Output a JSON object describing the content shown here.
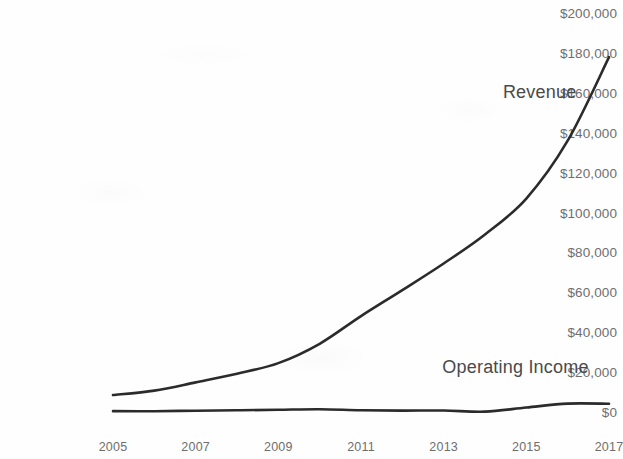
{
  "chart_data": {
    "type": "line",
    "title": "",
    "subtitle": "",
    "xlabel": "",
    "ylabel": "",
    "x": [
      2005,
      2006,
      2007,
      2008,
      2009,
      2010,
      2011,
      2012,
      2013,
      2014,
      2015,
      2016,
      2017
    ],
    "xlim": [
      2005,
      2017
    ],
    "ylim": [
      0,
      200000
    ],
    "ytick_values": [
      0,
      20000,
      40000,
      60000,
      80000,
      100000,
      120000,
      140000,
      160000,
      180000,
      200000
    ],
    "ytick_labels": [
      "$0",
      "$20,000",
      "$40,000",
      "$60,000",
      "$80,000",
      "$100,000",
      "$120,000",
      "$140,000",
      "$160,000",
      "$180,000",
      "$200,000"
    ],
    "xtick_values": [
      2005,
      2007,
      2009,
      2011,
      2013,
      2015,
      2017
    ],
    "xtick_labels": [
      "2005",
      "2007",
      "2009",
      "2011",
      "2013",
      "2015",
      "2017"
    ],
    "grid": false,
    "legend_position": "inline-annotation",
    "series": [
      {
        "name": "Revenue",
        "color": "#2b2b2b",
        "values": [
          8490,
          10710,
          14840,
          19170,
          24510,
          34200,
          48080,
          61090,
          74450,
          88990,
          107010,
          135990,
          177870
        ],
        "label_x": 2016.2,
        "label_y": 160000
      },
      {
        "name": "Operating Income",
        "color": "#2b2b2b",
        "values": [
          430,
          390,
          660,
          840,
          1130,
          1410,
          860,
          680,
          740,
          180,
          2230,
          4190,
          4110
        ],
        "label_x": 2016.5,
        "label_y": 22000
      }
    ]
  },
  "axis": {
    "y_label_color": "#6e6e6e",
    "x_label_color": "#6e6e6e",
    "line_color": "#2b2b2b",
    "background_color": "#fefefe"
  },
  "annotations": {
    "revenue_label": "Revenue",
    "operating_income_label": "Operating Income"
  }
}
